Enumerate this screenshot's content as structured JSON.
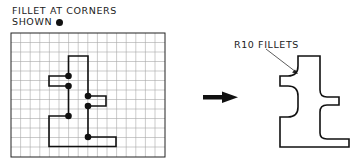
{
  "caption": {
    "line1": "FILLET AT CORNERS",
    "line2": "SHOWN",
    "marker": "filled-dot"
  },
  "right_label": "R10 FILLETS",
  "grid": {
    "columns": 16,
    "rows": 13
  },
  "fillet_corners_marked": 6,
  "colors": {
    "stroke": "#111111",
    "grid": "#9a9a9a",
    "background": "#ffffff"
  }
}
